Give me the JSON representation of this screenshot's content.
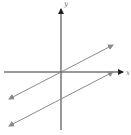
{
  "figure": {
    "type": "coordinate-plane-graph",
    "axes": {
      "x_label": "x",
      "y_label": "y"
    },
    "lines": [
      {
        "name": "line-through-origin",
        "slope": 0.5,
        "y_intercept": 0
      },
      {
        "name": "line-below",
        "slope": 0.5,
        "y_intercept": -1
      }
    ],
    "colors": {
      "axes": "#333333",
      "lines": "#8a8a8a"
    }
  }
}
